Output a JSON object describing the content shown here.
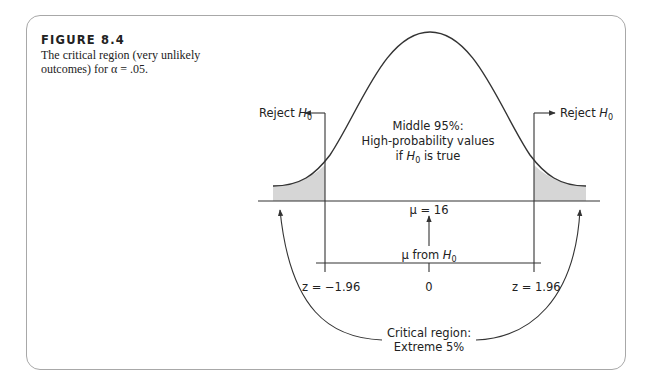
{
  "figure": {
    "number": "FIGURE 8.4",
    "caption": "The critical region (very unlikely outcomes) for α = .05."
  },
  "diagram": {
    "type": "normal-distribution",
    "labels": {
      "reject_left": "Reject",
      "reject_right": "Reject",
      "h0_symbol": "H",
      "h0_subscript": "0",
      "middle_line1": "Middle 95%:",
      "middle_line2": "High-probability values",
      "middle_line3_pre": "if ",
      "middle_line3_post": " is true",
      "mu_value": "μ = 16",
      "mu_from": "μ from ",
      "z_left": "z = −1.96",
      "z_center": "0",
      "z_right": "z = 1.96",
      "critical_line1": "Critical region:",
      "critical_line2": "Extreme 5%"
    },
    "colors": {
      "line": "#333333",
      "shade": "#d6d6d6",
      "frame": "#a8a8a8"
    }
  }
}
